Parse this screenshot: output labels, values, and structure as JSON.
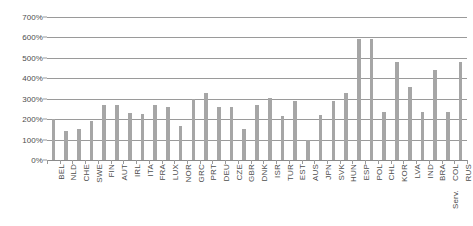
{
  "chart_data": {
    "type": "bar",
    "title": "",
    "subtitle": "",
    "xlabel": "",
    "ylabel": "",
    "ylim": [
      0,
      700
    ],
    "y_unit": "%",
    "grid": true,
    "legend": false,
    "legend_position": "none",
    "bar_color": "#a6a6a6",
    "gridline_color": "#9a9a9a",
    "text_color": "#4d4d4d",
    "y_ticks": [
      "0%",
      "100%",
      "200%",
      "300%",
      "400%",
      "500%",
      "600%",
      "700%"
    ],
    "y_tick_values": [
      0,
      100,
      200,
      300,
      400,
      500,
      600,
      700
    ],
    "categories": [
      "BEL",
      "NLD",
      "CHE",
      "SWE",
      "FIN",
      "AUT",
      "IRL",
      "ITA",
      "FRA",
      "LUX",
      "NOR",
      "GRC",
      "PRT",
      "DEU",
      "CZE",
      "GBR",
      "DNK",
      "ISR",
      "TUR",
      "EST",
      "AUS",
      "JPN",
      "SVK",
      "HUN",
      "ESP",
      "POL",
      "CHL",
      "KOR",
      "LVA",
      "IND",
      "BRA",
      "COL Serv.",
      "RUS"
    ],
    "values": [
      200,
      140,
      152,
      192,
      270,
      268,
      232,
      225,
      270,
      258,
      168,
      300,
      330,
      258,
      258,
      150,
      270,
      305,
      215,
      290,
      100,
      218,
      290,
      330,
      590,
      590,
      235,
      480,
      355,
      235,
      440,
      235,
      480
    ]
  }
}
